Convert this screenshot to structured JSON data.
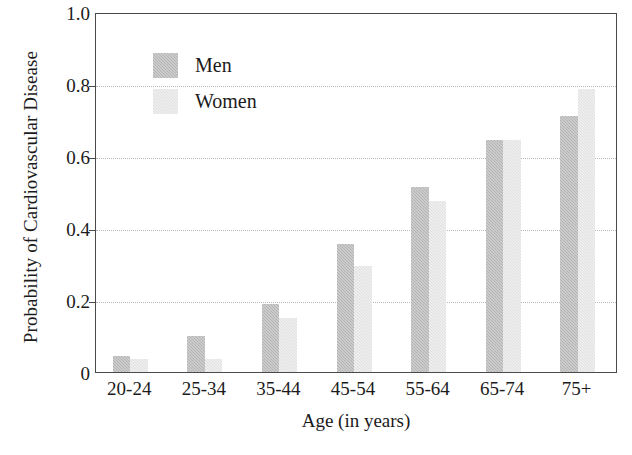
{
  "chart_data": {
    "type": "bar",
    "title": "",
    "xlabel": "Age (in years)",
    "ylabel": "Probability of Cardiovascular Disease",
    "categories": [
      "20-24",
      "25-34",
      "35-44",
      "45-54",
      "55-64",
      "65-74",
      "75+"
    ],
    "series": [
      {
        "name": "Men",
        "color": "#b4b4b4",
        "values": [
          0.045,
          0.1,
          0.19,
          0.355,
          0.515,
          0.645,
          0.71
        ]
      },
      {
        "name": "Women",
        "color": "#e0e0e0",
        "values": [
          0.035,
          0.035,
          0.15,
          0.295,
          0.475,
          0.645,
          0.785
        ]
      }
    ],
    "ylim": [
      0,
      1.0
    ],
    "y_ticks": [
      0,
      0.2,
      0.4,
      0.6,
      0.8,
      1.0
    ],
    "y_tick_labels": [
      "0",
      "0.2",
      "0.4",
      "0.6",
      "0.8",
      "1.0"
    ],
    "grid": true,
    "grid_axis": "y",
    "legend_position": "upper-left-inside",
    "legend_entries": [
      "Men",
      "Women"
    ],
    "bar_orientation": "vertical"
  },
  "axes": {
    "frame_color": "#4a4a4a",
    "gridline_color": "#b9b9b9",
    "background": "#ffffff"
  }
}
